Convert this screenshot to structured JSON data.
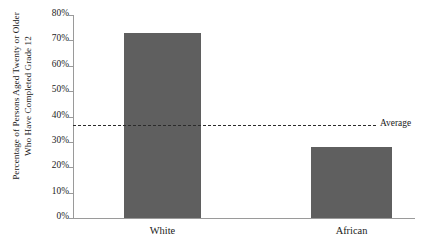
{
  "chart_data": {
    "type": "bar",
    "title": "",
    "subtitle": "",
    "xlabel": "",
    "ylabel": "Percentage of Persons Aged Twenty or Older Who Have Completed Grade 12",
    "ylabel_lines": [
      "Percentage of Persons Aged Twenty or Older",
      "Who Have Completed Grade 12"
    ],
    "categories": [
      "White",
      "African"
    ],
    "values": [
      73,
      28
    ],
    "ylim": [
      0,
      80
    ],
    "ytick_values": [
      0,
      10,
      20,
      30,
      40,
      50,
      60,
      70,
      80
    ],
    "ytick_labels": [
      "0%",
      "10%",
      "20%",
      "30%",
      "40%",
      "50%",
      "60%",
      "70%",
      "80%"
    ],
    "grid": false,
    "legend_position": "none",
    "bar_color": "#5f5f5f",
    "axis_color": "#9a9a9a",
    "annotations": [
      {
        "name": "average",
        "label": "Average",
        "value": 36.5,
        "style": "dashed",
        "color": "#2b2b2b"
      }
    ]
  }
}
